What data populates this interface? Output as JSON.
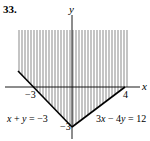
{
  "problem": {
    "number": "33."
  },
  "axes": {
    "x_label": "x",
    "y_label": "y"
  },
  "ticks": {
    "x_neg3": "−3",
    "x_4": "4",
    "y_neg3": "−3"
  },
  "lines": {
    "left": {
      "equation_parts": [
        "x",
        " + ",
        "y",
        " = −3"
      ],
      "equation": "x + y = −3"
    },
    "right": {
      "equation_parts": [
        "3",
        "x",
        " − 4",
        "y",
        " = 12"
      ],
      "equation": "3x − 4y = 12"
    }
  },
  "region": {
    "description": "Shaded region above both lines x + y = −3 and 3x − 4y = 12",
    "hatch": "vertical",
    "color": "#000000"
  }
}
